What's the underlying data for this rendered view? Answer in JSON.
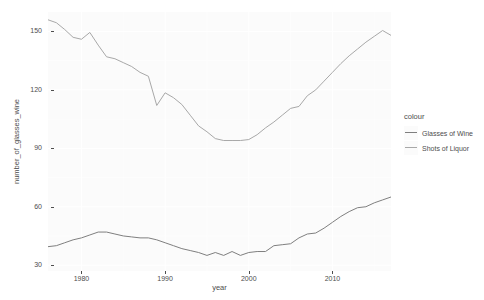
{
  "chart_data": {
    "type": "line",
    "title": "",
    "xlabel": "year",
    "ylabel": "number_of_glasses_wine",
    "xlim": [
      1976,
      2017
    ],
    "ylim": [
      27,
      160
    ],
    "grid": true,
    "legend_position": "right",
    "legend_title": "colour",
    "x_ticks": [
      1980,
      1990,
      2000,
      2010
    ],
    "y_ticks": [
      30,
      60,
      90,
      120,
      150
    ],
    "x": [
      1976,
      1977,
      1978,
      1979,
      1980,
      1981,
      1982,
      1983,
      1984,
      1985,
      1986,
      1987,
      1988,
      1989,
      1990,
      1991,
      1992,
      1993,
      1994,
      1995,
      1996,
      1997,
      1998,
      1999,
      2000,
      2001,
      2002,
      2003,
      2004,
      2005,
      2006,
      2007,
      2008,
      2009,
      2010,
      2011,
      2012,
      2013,
      2014,
      2015,
      2016,
      2017
    ],
    "series": [
      {
        "name": "Glasses of Wine",
        "color": "#7f7f7f",
        "values": [
          39.5,
          40.0,
          41.5,
          43.0,
          44.0,
          45.5,
          47.0,
          47.0,
          46.0,
          45.0,
          44.5,
          44.0,
          44.0,
          43.0,
          41.5,
          40.0,
          38.5,
          37.5,
          36.5,
          35.0,
          36.5,
          35.0,
          37.0,
          35.0,
          36.5,
          37.0,
          37.0,
          40.0,
          40.5,
          41.0,
          44.0,
          46.0,
          46.5,
          49.0,
          52.0,
          55.0,
          57.5,
          59.5,
          60.0,
          62.0,
          63.5,
          65.0
        ]
      },
      {
        "name": "Shots of Liquor",
        "color": "#a8a8a8",
        "values": [
          156.0,
          154.5,
          151.0,
          147.0,
          146.0,
          149.5,
          143.0,
          137.0,
          136.0,
          134.0,
          132.0,
          129.0,
          127.0,
          112.0,
          118.5,
          116.0,
          112.5,
          107.0,
          101.5,
          98.5,
          95.0,
          94.0,
          94.0,
          94.0,
          94.5,
          97.0,
          100.5,
          103.5,
          107.0,
          110.5,
          111.5,
          117.0,
          120.0,
          124.5,
          129.0,
          133.5,
          137.5,
          141.0,
          144.5,
          147.5,
          150.5,
          148.0
        ]
      }
    ]
  },
  "axes": {
    "x_title": "year",
    "y_title": "number_of_glasses_wine",
    "x_tick_labels": [
      "1980",
      "1990",
      "2000",
      "2010"
    ],
    "y_tick_labels": [
      "30",
      "60",
      "90",
      "120",
      "150"
    ]
  },
  "legend": {
    "title": "colour",
    "items": [
      {
        "label": "Glasses of Wine",
        "color": "#7f7f7f"
      },
      {
        "label": "Shots of Liquor",
        "color": "#a8a8a8"
      }
    ]
  },
  "theme": {
    "panel_bg": "#fbfbfb",
    "grid_color": "#ffffff",
    "text_color": "#4d4d4d",
    "page_bg": "#ffffff"
  }
}
